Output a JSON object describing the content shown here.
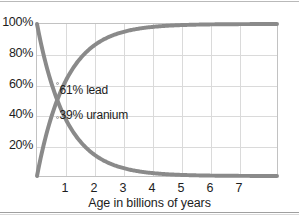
{
  "chart_data": {
    "type": "line",
    "title": "",
    "xlabel": "Age in billions of years",
    "ylabel": "",
    "xlim": [
      0,
      8.35
    ],
    "ylim": [
      0,
      100
    ],
    "grid": true,
    "legend_position": "inline-annotation",
    "x_ticks": [
      "1",
      "2",
      "3",
      "4",
      "5",
      "6",
      "7"
    ],
    "x_tick_values": [
      1,
      2,
      3,
      4,
      5,
      6,
      7
    ],
    "y_ticks": [
      "20%",
      "40%",
      "60%",
      "80%",
      "100%"
    ],
    "y_tick_values": [
      20,
      40,
      60,
      80,
      100
    ],
    "half_life_gyr": 0.704,
    "x": [
      0,
      0.2,
      0.4,
      0.6,
      0.704,
      0.8,
      1.0,
      1.2,
      1.4,
      1.6,
      1.8,
      2.0,
      2.4,
      2.8,
      3.2,
      3.6,
      4.0,
      4.5,
      5.0,
      5.5,
      6.0,
      6.5,
      7.0,
      7.5,
      8.0,
      8.35
    ],
    "series": [
      {
        "name": "lead",
        "annotation": "61% lead",
        "color": "#8a8a8a",
        "values": [
          0,
          17.8,
          32.4,
          44.4,
          50.0,
          54.3,
          62.4,
          69.0,
          74.5,
          79.0,
          82.7,
          85.8,
          90.4,
          93.5,
          95.6,
          97.0,
          98.0,
          98.8,
          99.2,
          99.5,
          99.7,
          99.8,
          99.9,
          99.9,
          100,
          100
        ]
      },
      {
        "name": "uranium",
        "annotation": "39% uranium",
        "color": "#8a8a8a",
        "values": [
          100,
          82.2,
          67.6,
          55.6,
          50.0,
          45.7,
          37.6,
          31.0,
          25.5,
          21.0,
          17.3,
          14.2,
          9.6,
          6.5,
          4.4,
          3.0,
          2.0,
          1.2,
          0.8,
          0.5,
          0.3,
          0.2,
          0.1,
          0.1,
          0,
          0
        ]
      }
    ],
    "annotations": [
      {
        "id": "lead-annotation",
        "text": "61% lead",
        "x": 0.78,
        "y": 57
      },
      {
        "id": "uranium-annotation",
        "text": "39% uranium",
        "x": 0.78,
        "y": 41
      }
    ],
    "marker_points": [
      {
        "id": "lead-marker",
        "x": 0.72,
        "y": 61
      },
      {
        "id": "uranium-marker",
        "x": 0.72,
        "y": 39
      }
    ]
  },
  "axes": {
    "y_ticks": [
      {
        "label": "100%",
        "value": 100
      },
      {
        "label": "80%",
        "value": 80
      },
      {
        "label": "60%",
        "value": 60
      },
      {
        "label": "40%",
        "value": 40
      },
      {
        "label": "20%",
        "value": 20
      }
    ],
    "x_ticks": [
      {
        "label": "1",
        "value": 1
      },
      {
        "label": "2",
        "value": 2
      },
      {
        "label": "3",
        "value": 3
      },
      {
        "label": "4",
        "value": 4
      },
      {
        "label": "5",
        "value": 5
      },
      {
        "label": "6",
        "value": 6
      },
      {
        "label": "7",
        "value": 7
      }
    ],
    "x_title": "Age in billions of years"
  },
  "colors": {
    "curve": "#8a8a8a",
    "gridline": "#dadada",
    "frame": "#c2c2c2",
    "text": "#1d1d1d",
    "background": "#ffffff",
    "page_rule": "#b9b9b9"
  }
}
